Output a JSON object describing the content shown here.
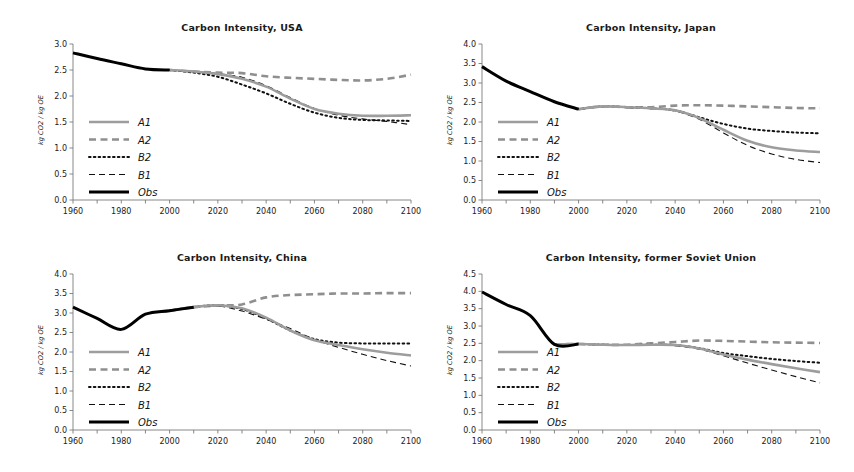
{
  "figure": {
    "panel_count": 4,
    "background": "#ffffff"
  },
  "common": {
    "ylabel": "kg CO2 / kg OE",
    "xticks": [
      1960,
      1980,
      2000,
      2020,
      2040,
      2060,
      2080,
      2100
    ],
    "xlim": [
      1960,
      2100
    ],
    "legend_entries": [
      {
        "label": "A1",
        "style": "solid-thick-gray",
        "color": "#9d9d9d"
      },
      {
        "label": "A2",
        "style": "dashed-thick-gray",
        "color": "#8f8f8f"
      },
      {
        "label": "B2",
        "style": "dotted-black",
        "color": "#111111"
      },
      {
        "label": "B1",
        "style": "dashed-thin-black",
        "color": "#111111"
      },
      {
        "label": "Obs",
        "style": "solid-thick-black",
        "color": "#000000"
      }
    ]
  },
  "chart_data": [
    {
      "type": "line",
      "id": "usa",
      "title": "Carbon Intensity, USA",
      "xlabel": "",
      "ylabel": "kg CO2 / kg OE",
      "xlim": [
        1960,
        2100
      ],
      "ylim": [
        0.0,
        3.0
      ],
      "yticks": [
        0.0,
        0.5,
        1.0,
        1.5,
        2.0,
        2.5,
        3.0
      ],
      "xticks": [
        1960,
        1980,
        2000,
        2020,
        2040,
        2060,
        2080,
        2100
      ],
      "grid": false,
      "legend_position": "center-left",
      "x": [
        1960,
        1970,
        1980,
        1990,
        2000,
        2010,
        2020,
        2030,
        2040,
        2050,
        2060,
        2070,
        2080,
        2090,
        2100
      ],
      "series": [
        {
          "name": "Obs",
          "values": [
            2.83,
            2.72,
            2.62,
            2.52,
            2.5,
            null,
            null,
            null,
            null,
            null,
            null,
            null,
            null,
            null,
            null
          ]
        },
        {
          "name": "A1",
          "values": [
            null,
            null,
            null,
            null,
            2.5,
            2.47,
            2.42,
            2.33,
            2.18,
            1.95,
            1.75,
            1.66,
            1.62,
            1.62,
            1.63
          ]
        },
        {
          "name": "A2",
          "values": [
            null,
            null,
            null,
            null,
            2.5,
            2.47,
            2.45,
            2.44,
            2.38,
            2.35,
            2.33,
            2.31,
            2.3,
            2.33,
            2.41
          ]
        },
        {
          "name": "B2",
          "values": [
            null,
            null,
            null,
            null,
            2.5,
            2.45,
            2.37,
            2.22,
            2.05,
            1.85,
            1.68,
            1.58,
            1.54,
            1.53,
            1.52
          ]
        },
        {
          "name": "B1",
          "values": [
            null,
            null,
            null,
            null,
            2.5,
            2.47,
            2.43,
            2.36,
            2.2,
            1.97,
            1.76,
            1.63,
            1.56,
            1.51,
            1.45
          ]
        }
      ]
    },
    {
      "type": "line",
      "id": "japan",
      "title": "Carbon Intensity, Japan",
      "xlabel": "",
      "ylabel": "kg CO2 / kg OE",
      "xlim": [
        1960,
        2100
      ],
      "ylim": [
        0.0,
        4.0
      ],
      "yticks": [
        0.0,
        0.5,
        1.0,
        1.5,
        2.0,
        2.5,
        3.0,
        3.5,
        4.0
      ],
      "xticks": [
        1960,
        1980,
        2000,
        2020,
        2040,
        2060,
        2080,
        2100
      ],
      "grid": false,
      "legend_position": "center-left",
      "x": [
        1960,
        1970,
        1980,
        1990,
        2000,
        2010,
        2020,
        2030,
        2040,
        2050,
        2060,
        2070,
        2080,
        2090,
        2100
      ],
      "series": [
        {
          "name": "Obs",
          "values": [
            3.42,
            3.05,
            2.78,
            2.52,
            2.33,
            null,
            null,
            null,
            null,
            null,
            null,
            null,
            null,
            null,
            null
          ]
        },
        {
          "name": "A1",
          "values": [
            null,
            null,
            null,
            null,
            2.33,
            2.4,
            2.38,
            2.35,
            2.3,
            2.1,
            1.8,
            1.52,
            1.35,
            1.27,
            1.23
          ]
        },
        {
          "name": "A2",
          "values": [
            null,
            null,
            null,
            null,
            2.33,
            2.4,
            2.38,
            2.38,
            2.42,
            2.43,
            2.42,
            2.4,
            2.38,
            2.36,
            2.35
          ]
        },
        {
          "name": "B2",
          "values": [
            null,
            null,
            null,
            null,
            2.33,
            2.4,
            2.38,
            2.35,
            2.3,
            2.12,
            1.95,
            1.83,
            1.77,
            1.73,
            1.71
          ]
        },
        {
          "name": "B1",
          "values": [
            null,
            null,
            null,
            null,
            2.33,
            2.4,
            2.37,
            2.34,
            2.28,
            2.07,
            1.72,
            1.4,
            1.18,
            1.04,
            0.96
          ]
        }
      ]
    },
    {
      "type": "line",
      "id": "china",
      "title": "Carbon Intensity, China",
      "xlabel": "",
      "ylabel": "kg CO2 / kg OE",
      "xlim": [
        1960,
        2100
      ],
      "ylim": [
        0.0,
        4.0
      ],
      "yticks": [
        0.0,
        0.5,
        1.0,
        1.5,
        2.0,
        2.5,
        3.0,
        3.5,
        4.0
      ],
      "xticks": [
        1960,
        1980,
        2000,
        2020,
        2040,
        2060,
        2080,
        2100
      ],
      "grid": false,
      "legend_position": "center-left",
      "x": [
        1960,
        1970,
        1980,
        1990,
        2000,
        2010,
        2020,
        2030,
        2040,
        2050,
        2060,
        2070,
        2080,
        2090,
        2100
      ],
      "series": [
        {
          "name": "Obs",
          "values": [
            3.15,
            2.86,
            2.58,
            2.97,
            3.06,
            3.15,
            null,
            null,
            null,
            null,
            null,
            null,
            null,
            null,
            null
          ]
        },
        {
          "name": "A1",
          "values": [
            null,
            null,
            null,
            null,
            3.06,
            3.15,
            3.2,
            3.12,
            2.88,
            2.55,
            2.3,
            2.18,
            2.07,
            1.98,
            1.91
          ]
        },
        {
          "name": "A2",
          "values": [
            null,
            null,
            null,
            null,
            3.06,
            3.15,
            3.19,
            3.22,
            3.4,
            3.46,
            3.48,
            3.5,
            3.5,
            3.51,
            3.51
          ]
        },
        {
          "name": "B2",
          "values": [
            null,
            null,
            null,
            null,
            3.06,
            3.15,
            3.2,
            3.1,
            2.86,
            2.55,
            2.33,
            2.24,
            2.22,
            2.22,
            2.22
          ]
        },
        {
          "name": "B1",
          "values": [
            null,
            null,
            null,
            null,
            3.06,
            3.15,
            3.18,
            3.05,
            2.84,
            2.6,
            2.32,
            2.12,
            1.94,
            1.78,
            1.64
          ]
        }
      ]
    },
    {
      "type": "line",
      "id": "former-soviet-union",
      "title": "Carbon Intensity, former Soviet Union",
      "xlabel": "",
      "ylabel": "kg CO2 / kg OE",
      "xlim": [
        1960,
        2100
      ],
      "ylim": [
        0.0,
        4.5
      ],
      "yticks": [
        0.0,
        0.5,
        1.0,
        1.5,
        2.0,
        2.5,
        3.0,
        3.5,
        4.0,
        4.5
      ],
      "xticks": [
        1960,
        1980,
        2000,
        2020,
        2040,
        2060,
        2080,
        2100
      ],
      "grid": false,
      "legend_position": "center-left",
      "x": [
        1960,
        1970,
        1980,
        1990,
        2000,
        2010,
        2020,
        2030,
        2040,
        2050,
        2060,
        2070,
        2080,
        2090,
        2100
      ],
      "series": [
        {
          "name": "Obs",
          "values": [
            3.98,
            3.62,
            3.3,
            2.47,
            2.48,
            null,
            null,
            null,
            null,
            null,
            null,
            null,
            null,
            null,
            null
          ]
        },
        {
          "name": "A1",
          "values": [
            null,
            null,
            null,
            2.47,
            2.48,
            2.46,
            2.45,
            2.46,
            2.45,
            2.35,
            2.18,
            2.03,
            1.9,
            1.78,
            1.67
          ]
        },
        {
          "name": "A2",
          "values": [
            null,
            null,
            null,
            2.47,
            2.48,
            2.46,
            2.46,
            2.5,
            2.54,
            2.58,
            2.57,
            2.55,
            2.53,
            2.52,
            2.51
          ]
        },
        {
          "name": "B2",
          "values": [
            null,
            null,
            null,
            2.47,
            2.48,
            2.46,
            2.45,
            2.46,
            2.45,
            2.36,
            2.22,
            2.13,
            2.05,
            1.99,
            1.94
          ]
        },
        {
          "name": "B1",
          "values": [
            null,
            null,
            null,
            2.47,
            2.48,
            2.46,
            2.45,
            2.45,
            2.43,
            2.33,
            2.14,
            1.93,
            1.73,
            1.54,
            1.36
          ]
        }
      ]
    }
  ]
}
